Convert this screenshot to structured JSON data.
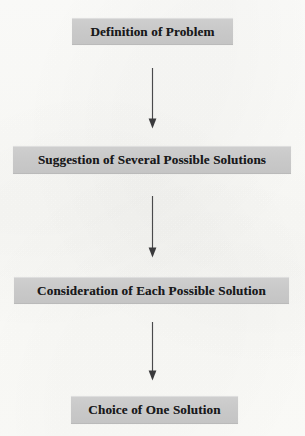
{
  "diagram": {
    "orientation": "vertical-top-down",
    "background_color": "#fdfdfb",
    "node_fill_color": "#c9c9c9",
    "node_text_color": "#19191b",
    "connector_color": "#4a4a4c",
    "nodes": [
      {
        "id": "node-1",
        "label": "Definition of Problem"
      },
      {
        "id": "node-2",
        "label": "Suggestion of Several Possible Solutions"
      },
      {
        "id": "node-3",
        "label": "Consideration of Each Possible Solution"
      },
      {
        "id": "node-4",
        "label": "Choice of One Solution"
      }
    ],
    "connectors": [
      {
        "id": "arrow-1",
        "from": "node-1",
        "to": "node-2",
        "icon": "down-arrow-icon"
      },
      {
        "id": "arrow-2",
        "from": "node-2",
        "to": "node-3",
        "icon": "down-arrow-icon"
      },
      {
        "id": "arrow-3",
        "from": "node-3",
        "to": "node-4",
        "icon": "down-arrow-icon"
      }
    ]
  }
}
